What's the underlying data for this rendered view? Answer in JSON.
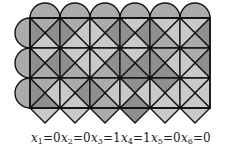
{
  "diagram": {
    "grid": {
      "columns": 6,
      "rows": 3,
      "origin_x": 30,
      "origin_y": 18,
      "cell_size": 30
    },
    "colors": {
      "light": "#c9c9c9",
      "medium": "#ababab",
      "dark": "#8f8f8f",
      "stroke": "#111111",
      "cap": "#a0a0a0"
    },
    "cells": [
      [
        {
          "top": "medium",
          "right": "dark",
          "bottom": "light",
          "left": "dark"
        },
        {
          "top": "medium",
          "right": "light",
          "bottom": "light",
          "left": "dark"
        },
        {
          "top": "medium",
          "right": "dark",
          "bottom": "light",
          "left": "light"
        },
        {
          "top": "light",
          "right": "dark",
          "bottom": "light",
          "left": "dark"
        },
        {
          "top": "light",
          "right": "light",
          "bottom": "medium",
          "left": "dark"
        },
        {
          "top": "light",
          "right": "dark",
          "bottom": "medium",
          "left": "light"
        }
      ],
      [
        {
          "top": "light",
          "right": "dark",
          "bottom": "medium",
          "left": "dark"
        },
        {
          "top": "light",
          "right": "light",
          "bottom": "medium",
          "left": "dark"
        },
        {
          "top": "light",
          "right": "dark",
          "bottom": "medium",
          "left": "light"
        },
        {
          "top": "light",
          "right": "dark",
          "bottom": "dark",
          "left": "dark"
        },
        {
          "top": "medium",
          "right": "light",
          "bottom": "dark",
          "left": "dark"
        },
        {
          "top": "medium",
          "right": "dark",
          "bottom": "light",
          "left": "light"
        }
      ],
      [
        {
          "top": "medium",
          "right": "light",
          "bottom": "dark",
          "left": "dark"
        },
        {
          "top": "medium",
          "right": "dark",
          "bottom": "light",
          "left": "light"
        },
        {
          "top": "medium",
          "right": "light",
          "bottom": "medium",
          "left": "dark"
        },
        {
          "top": "dark",
          "right": "light",
          "bottom": "dark",
          "left": "light"
        },
        {
          "top": "dark",
          "right": "light",
          "bottom": "light",
          "left": "light"
        },
        {
          "top": "light",
          "right": "light",
          "bottom": "light",
          "left": "light"
        }
      ]
    ],
    "top_caps": [
      "medium",
      "medium",
      "medium",
      "medium",
      "medium",
      "medium"
    ],
    "left_caps": [
      "medium",
      "medium",
      "medium"
    ],
    "bottom_diamonds": [
      "light",
      "light",
      "medium",
      "dark",
      "light",
      "light"
    ],
    "labels": [
      {
        "var": "x",
        "sub": "1",
        "value": "=0"
      },
      {
        "var": "x",
        "sub": "2",
        "value": "=0"
      },
      {
        "var": "x",
        "sub": "3",
        "value": "=1"
      },
      {
        "var": "x",
        "sub": "4",
        "value": "=1"
      },
      {
        "var": "x",
        "sub": "5",
        "value": "=0"
      },
      {
        "var": "x",
        "sub": "6",
        "value": "=0"
      }
    ]
  }
}
